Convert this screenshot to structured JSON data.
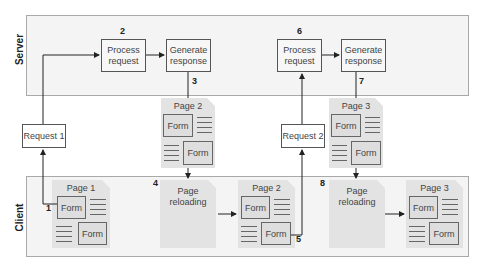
{
  "zones": {
    "server": {
      "label": "Server"
    },
    "client": {
      "label": "Client"
    }
  },
  "server_steps": [
    {
      "step": "2",
      "process": "Process\nrequest",
      "generate": "Generate\nresponse",
      "gen_step": "3"
    },
    {
      "step": "6",
      "process": "Process\nrequest",
      "generate": "Generate\nresponse",
      "gen_step": "7"
    }
  ],
  "requests": [
    {
      "label": "Request 1"
    },
    {
      "label": "Request 2"
    }
  ],
  "transit_pages": [
    {
      "title": "Page 2",
      "form1": "Form",
      "form2": "Form"
    },
    {
      "title": "Page 3",
      "form1": "Form",
      "form2": "Form"
    }
  ],
  "client_pages": [
    {
      "title": "Page 1",
      "form1": "Form",
      "form2": "Form",
      "step": "1"
    },
    {
      "title": "Page 2",
      "form1": "Form",
      "form2": "Form",
      "step": "5"
    },
    {
      "title": "Page 3",
      "form1": "Form",
      "form2": "Form"
    }
  ],
  "reloading": [
    {
      "text": "Page\nreloading",
      "step": "4"
    },
    {
      "text": "Page\nreloading",
      "step": "8"
    }
  ],
  "colors": {
    "zone_bg": "#f4f4f4",
    "page_bg": "#e3e3e3",
    "line": "#222222"
  }
}
